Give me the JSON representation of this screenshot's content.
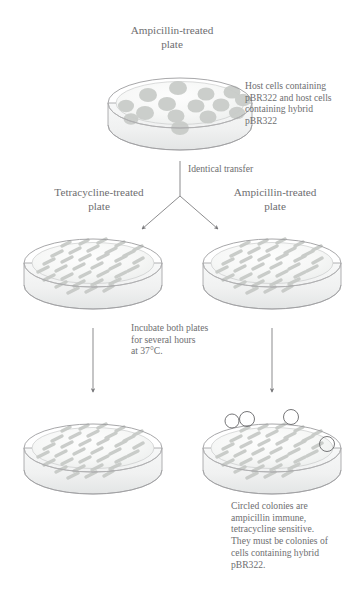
{
  "figure": {
    "kind": "scientific-diagram",
    "topic": "pBR322 plasmid replica plating screen",
    "background_color": "#ffffff",
    "ink_color": "#6e6e70",
    "dish_outline_color": "#9a9a9c",
    "colony_color": "#c9ccc9",
    "streak_color": "#c6c9c6",
    "circle_marker_color": "#6f6f71"
  },
  "labels": {
    "top_plate_title": "Ampicillin-treated\nplate",
    "tetracycline_plate_title": "Tetracycline-treated\nplate",
    "ampicillin_plate_title": "Ampicillin-treated\nplate",
    "host_cells_note": "Host cells containing\npBR322 and host cells\ncontaining hybrid\npBR322",
    "identical_transfer": "Identical transfer",
    "incubate_note": "Incubate both plates\nfor several hours\nat 37°C.",
    "circled_note": "Circled colonies are\nampicillin immune,\ntetracycline sensitive.\nThey must be colonies of\ncells containing hybrid\npBR322."
  },
  "plates": [
    {
      "id": "plate-top-ampicillin",
      "row": 1,
      "title": "Ampicillin-treated plate",
      "growth_style": "round-colonies",
      "colony_count": 15,
      "circled_colony_count": 0,
      "center": [
        180,
        103
      ]
    },
    {
      "id": "plate-mid-tetracycline",
      "row": 2,
      "title": "Tetracycline-treated plate",
      "growth_style": "streaks",
      "streak_count": 34,
      "circled_colony_count": 0,
      "center": [
        93,
        263
      ]
    },
    {
      "id": "plate-mid-ampicillin",
      "row": 2,
      "title": "Ampicillin-treated plate",
      "growth_style": "streaks",
      "streak_count": 34,
      "circled_colony_count": 0,
      "center": [
        272,
        263
      ]
    },
    {
      "id": "plate-bottom-tetracycline",
      "row": 3,
      "title": "Tetracycline-treated plate (after incubation)",
      "growth_style": "streaks",
      "streak_count": 34,
      "circled_colony_count": 0,
      "center": [
        93,
        448
      ]
    },
    {
      "id": "plate-bottom-ampicillin",
      "row": 3,
      "title": "Ampicillin-treated plate (after incubation)",
      "growth_style": "streaks",
      "streak_count": 34,
      "circled_colony_count": 4,
      "center": [
        272,
        448
      ]
    }
  ],
  "circled_colonies": [
    {
      "x": 232,
      "y": 421,
      "r": 7
    },
    {
      "x": 247,
      "y": 419,
      "r": 7.5
    },
    {
      "x": 291,
      "y": 417,
      "r": 7.5
    },
    {
      "x": 327,
      "y": 444,
      "r": 7.5
    }
  ],
  "arrows": [
    {
      "id": "arrow-transfer-stem",
      "from": [
        180,
        162
      ],
      "to": [
        180,
        196
      ],
      "head": false
    },
    {
      "id": "arrow-transfer-left",
      "from": [
        180,
        196
      ],
      "to": [
        144,
        228
      ],
      "head": true
    },
    {
      "id": "arrow-transfer-right",
      "from": [
        180,
        196
      ],
      "to": [
        216,
        228
      ],
      "head": true
    },
    {
      "id": "arrow-incubate-left",
      "from": [
        93,
        327
      ],
      "to": [
        93,
        390
      ],
      "head": true
    },
    {
      "id": "arrow-incubate-right",
      "from": [
        272,
        327
      ],
      "to": [
        272,
        390
      ],
      "head": true
    }
  ]
}
